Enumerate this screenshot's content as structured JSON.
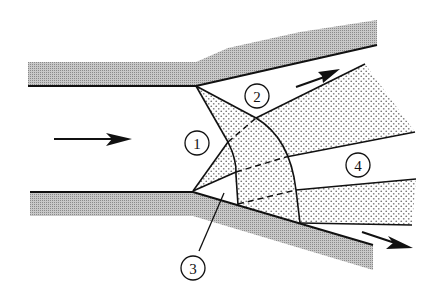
{
  "diagram": {
    "type": "nozzle-shock-expansion-schematic",
    "colors": {
      "line": "#111111",
      "wall_shade": "#9a9a9a",
      "stipple": "#7a7a7a",
      "background": "#ffffff"
    },
    "labels": [
      {
        "id": "1",
        "text": "1"
      },
      {
        "id": "2",
        "text": "2"
      },
      {
        "id": "3",
        "text": "3"
      },
      {
        "id": "4",
        "text": "4"
      }
    ],
    "arrows": [
      {
        "name": "inflow-arrow",
        "direction": "right"
      },
      {
        "name": "upper-outflow-arrow",
        "direction": "up-right"
      },
      {
        "name": "lower-outflow-arrow",
        "direction": "down-right"
      }
    ]
  }
}
